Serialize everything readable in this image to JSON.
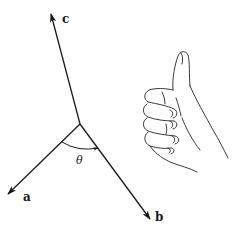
{
  "figure": {
    "colors": {
      "ink": "#1a1a1a",
      "background": "#ffffff"
    },
    "vectors": [
      {
        "id": "a",
        "label": "a",
        "from": [
          80,
          124
        ],
        "to": [
          8,
          194
        ],
        "label_pos": [
          23,
          201
        ]
      },
      {
        "id": "b",
        "label": "b",
        "from": [
          80,
          124
        ],
        "to": [
          150,
          219
        ],
        "label_pos": [
          155,
          221
        ]
      },
      {
        "id": "c",
        "label": "c",
        "from": [
          80,
          124
        ],
        "to": [
          51,
          14
        ],
        "label_pos": [
          62,
          23
        ]
      }
    ],
    "angle": {
      "label": "θ",
      "between": [
        "a",
        "b"
      ],
      "label_pos": [
        76,
        163
      ]
    },
    "hand": {
      "gesture": "thumbs-up",
      "meaning": "right-hand rule, thumb points along c"
    }
  }
}
